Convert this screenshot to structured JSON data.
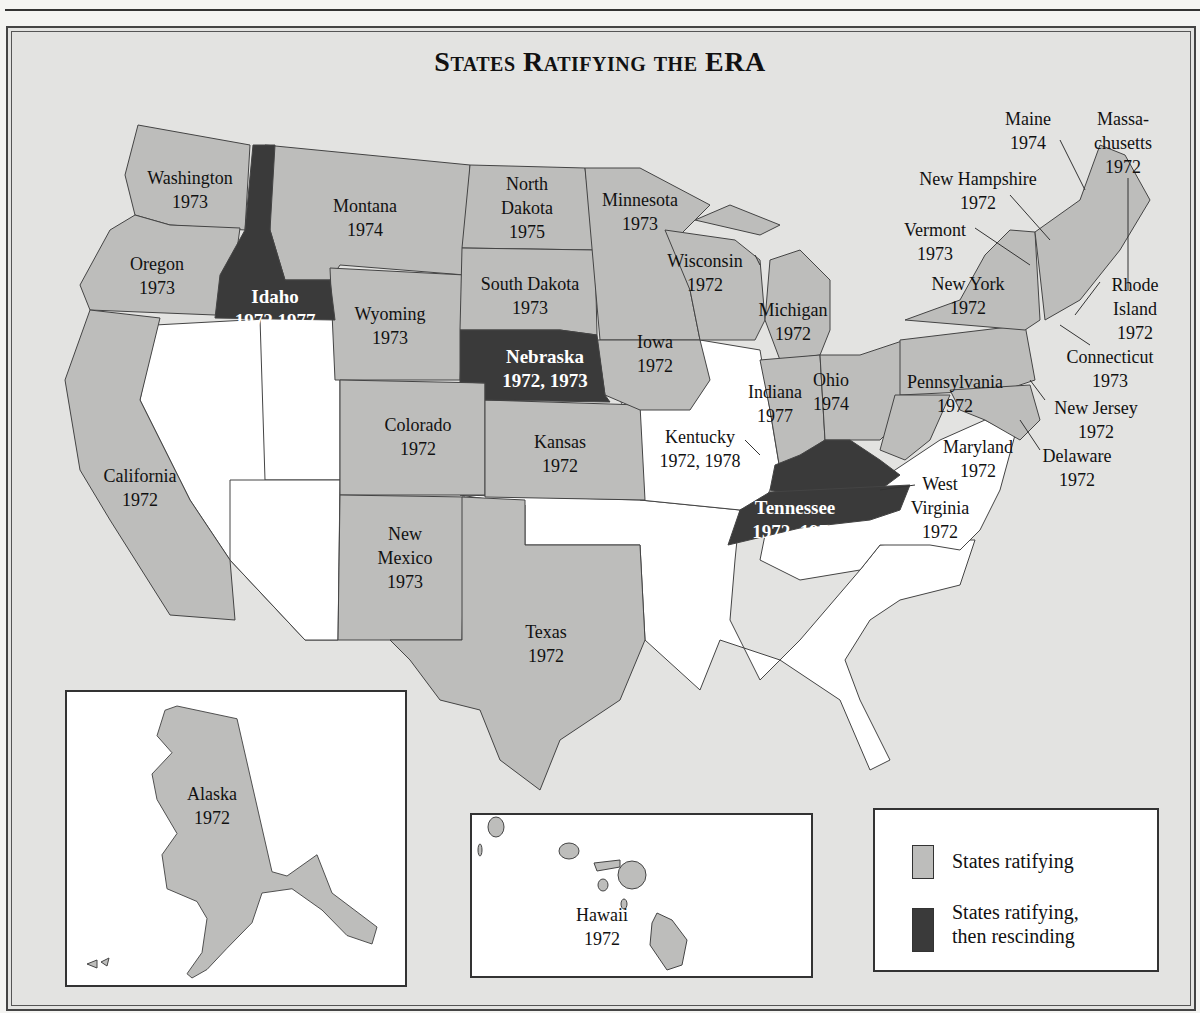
{
  "title": "States Ratifying the ERA",
  "colors": {
    "ratifying": "#bdbdbb",
    "rescinding": "#3a3a3a",
    "not_ratified": "#ffffff",
    "background": "#e3e3e1"
  },
  "states": {
    "washington": {
      "name": "Washington",
      "year": "1973"
    },
    "oregon": {
      "name": "Oregon",
      "year": "1973"
    },
    "california": {
      "name": "California",
      "year": "1972"
    },
    "idaho": {
      "name": "Idaho",
      "year": "1972,1977"
    },
    "montana": {
      "name": "Montana",
      "year": "1974"
    },
    "wyoming": {
      "name": "Wyoming",
      "year": "1973"
    },
    "colorado": {
      "name": "Colorado",
      "year": "1972"
    },
    "new_mexico": {
      "name1": "New",
      "name2": "Mexico",
      "year": "1973"
    },
    "north_dakota": {
      "name1": "North",
      "name2": "Dakota",
      "year": "1975"
    },
    "south_dakota": {
      "name": "South Dakota",
      "year": "1973"
    },
    "nebraska": {
      "name": "Nebraska",
      "year": "1972, 1973"
    },
    "kansas": {
      "name": "Kansas",
      "year": "1972"
    },
    "texas": {
      "name": "Texas",
      "year": "1972"
    },
    "minnesota": {
      "name": "Minnesota",
      "year": "1973"
    },
    "iowa": {
      "name": "Iowa",
      "year": "1972"
    },
    "wisconsin": {
      "name": "Wisconsin",
      "year": "1972"
    },
    "michigan": {
      "name": "Michigan",
      "year": "1972"
    },
    "indiana": {
      "name": "Indiana",
      "year": "1977"
    },
    "ohio": {
      "name": "Ohio",
      "year": "1974"
    },
    "kentucky": {
      "name": "Kentucky",
      "year": "1972, 1978"
    },
    "tennessee": {
      "name": "Tennessee",
      "year": "1972, 1974"
    },
    "west_virginia": {
      "name1": "West",
      "name2": "Virginia",
      "year": "1972"
    },
    "pennsylvania": {
      "name": "Pennsylvania",
      "year": "1972"
    },
    "new_york": {
      "name": "New York",
      "year": "1972"
    },
    "maryland": {
      "name": "Maryland",
      "year": "1972"
    },
    "delaware": {
      "name": "Delaware",
      "year": "1972"
    },
    "new_jersey": {
      "name": "New Jersey",
      "year": "1972"
    },
    "connecticut": {
      "name": "Connecticut",
      "year": "1973"
    },
    "rhode_island": {
      "name1": "Rhode",
      "name2": "Island",
      "year": "1972"
    },
    "vermont": {
      "name": "Vermont",
      "year": "1973"
    },
    "new_hampshire": {
      "name": "New Hampshire",
      "year": "1972"
    },
    "maine": {
      "name": "Maine",
      "year": "1974"
    },
    "massachusetts": {
      "name1": "Massa-",
      "name2": "chusetts",
      "year": "1972"
    },
    "alaska": {
      "name": "Alaska",
      "year": "1972"
    },
    "hawaii": {
      "name": "Hawaii",
      "year": "1972"
    }
  },
  "legend": {
    "ratifying": "States ratifying",
    "rescinding_1": "States ratifying,",
    "rescinding_2": "then rescinding"
  }
}
